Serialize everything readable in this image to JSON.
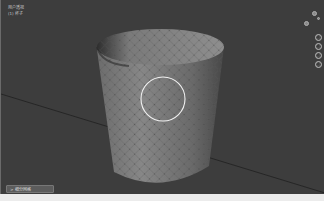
{
  "viewport": {
    "view_label": "用户透视",
    "object_label": "(1) 杯子",
    "background_color": "#3d3d3d",
    "brush_cursor": {
      "cx": 162,
      "cy": 99,
      "r": 22,
      "color": "#f2f2f2"
    }
  },
  "navigation": {
    "gizmo_axes": [
      "x-axis",
      "y-axis",
      "z-axis"
    ],
    "buttons": [
      {
        "name": "zoom-button",
        "icon": "magnifier-icon"
      },
      {
        "name": "pan-button",
        "icon": "hand-icon"
      },
      {
        "name": "camera-view-button",
        "icon": "camera-icon"
      },
      {
        "name": "perspective-toggle-button",
        "icon": "grid-icon"
      }
    ]
  },
  "operator_panel": {
    "label": "> 细分网格"
  }
}
